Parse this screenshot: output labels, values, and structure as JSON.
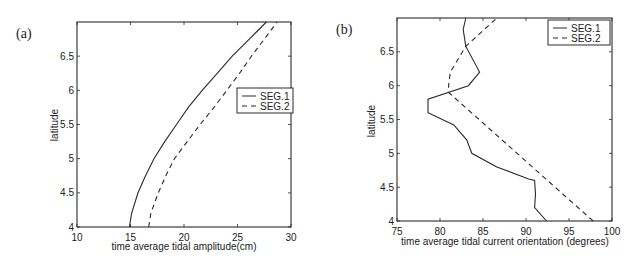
{
  "chart_data": [
    {
      "panel": "(a)",
      "type": "line",
      "xlabel": "time average tidal amplitude(cm)",
      "ylabel": "latitude",
      "xlim": [
        10,
        30
      ],
      "ylim": [
        4,
        7
      ],
      "xticks": [
        10,
        15,
        20,
        25,
        30
      ],
      "yticks": [
        4,
        4.5,
        5,
        5.5,
        6,
        6.5
      ],
      "ytick_labels": [
        "4",
        "4.5",
        "5",
        "5.5",
        "6",
        "6.5"
      ],
      "xtick_labels": [
        "10",
        "15",
        "20",
        "25",
        "30"
      ],
      "grid": false,
      "legend_position": "right-middle",
      "series": [
        {
          "name": "SEG.1",
          "style": "solid",
          "x": [
            14.9,
            15.1,
            15.7,
            16.4,
            17.2,
            18.2,
            19.3,
            20.4,
            21.7,
            23.1,
            24.5,
            26.1,
            27.7
          ],
          "y": [
            4.0,
            4.2,
            4.5,
            4.75,
            5.0,
            5.25,
            5.5,
            5.75,
            6.0,
            6.25,
            6.5,
            6.75,
            7.0
          ]
        },
        {
          "name": "SEG.2",
          "style": "dashed",
          "x": [
            16.7,
            16.9,
            17.6,
            18.3,
            19.1,
            20.3,
            21.5,
            22.8,
            24.0,
            25.2,
            26.3,
            27.5,
            28.7
          ],
          "y": [
            4.0,
            4.2,
            4.5,
            4.75,
            5.0,
            5.25,
            5.5,
            5.75,
            6.0,
            6.25,
            6.5,
            6.75,
            7.0
          ]
        }
      ],
      "frame": {
        "left": 77,
        "top": 22,
        "right": 291,
        "bottom": 227
      },
      "legend_box": {
        "x": 237,
        "y": 88,
        "w": 56,
        "h": 25
      },
      "label_pos": {
        "x": 16,
        "y": 38
      },
      "ylabel_pos": {
        "x": 58,
        "y": 125
      },
      "xlabel_pos": {
        "x": 184,
        "y": 250
      }
    },
    {
      "panel": "(b)",
      "type": "line",
      "xlabel": "time average tidal current orientation (degrees)",
      "ylabel": "latitude",
      "xlim": [
        75,
        100
      ],
      "ylim": [
        4,
        7
      ],
      "xticks": [
        75,
        80,
        85,
        90,
        95,
        100
      ],
      "yticks": [
        4,
        4.5,
        5,
        5.5,
        6,
        6.5
      ],
      "ytick_labels": [
        "4",
        "4.5",
        "5",
        "5.5",
        "6",
        "6.5"
      ],
      "xtick_labels": [
        "75",
        "80",
        "85",
        "90",
        "95",
        "100"
      ],
      "grid": false,
      "legend_position": "upper-right",
      "series": [
        {
          "name": "SEG.1",
          "style": "solid",
          "x": [
            92.4,
            91.0,
            91.1,
            91.0,
            90.3,
            86.6,
            83.7,
            83.1,
            81.6,
            78.6,
            78.6,
            83.3,
            84.6,
            83.0,
            82.7,
            83.0
          ],
          "y": [
            4.0,
            4.2,
            4.4,
            4.6,
            4.62,
            4.8,
            5.0,
            5.2,
            5.42,
            5.6,
            5.8,
            6.0,
            6.2,
            6.58,
            6.83,
            7.0
          ]
        },
        {
          "name": "SEG.2",
          "style": "dashed",
          "x": [
            97.8,
            81.0,
            81.0,
            81.2,
            83.0,
            86.6
          ],
          "y": [
            4.0,
            5.9,
            6.0,
            6.2,
            6.58,
            7.0
          ]
        }
      ],
      "frame": {
        "left": 397,
        "top": 18,
        "right": 612,
        "bottom": 221
      },
      "legend_box": {
        "x": 548,
        "y": 20,
        "w": 62,
        "h": 25
      },
      "label_pos": {
        "x": 336,
        "y": 34
      },
      "ylabel_pos": {
        "x": 375,
        "y": 121
      },
      "xlabel_pos": {
        "x": 505,
        "y": 245
      }
    }
  ]
}
